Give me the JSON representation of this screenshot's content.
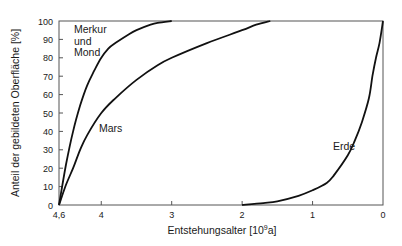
{
  "chart_data": {
    "type": "line",
    "title": "",
    "xlabel": "Entstehungsalter [10^9a]",
    "xlabel_main": "Entstehungsalter [10",
    "xlabel_sup": "9",
    "xlabel_tail": "a]",
    "ylabel": "Anteil der gebildeten Oberfläche [%]",
    "xlim": [
      4.6,
      0
    ],
    "ylim": [
      0,
      100
    ],
    "x_reversed": true,
    "grid": false,
    "x_ticks": [
      {
        "value": 4.6,
        "label": "4,6"
      },
      {
        "value": 4,
        "label": "4"
      },
      {
        "value": 3,
        "label": "3"
      },
      {
        "value": 2,
        "label": "2"
      },
      {
        "value": 1,
        "label": "1"
      },
      {
        "value": 0,
        "label": "0"
      }
    ],
    "y_ticks": [
      0,
      10,
      20,
      30,
      40,
      50,
      60,
      70,
      80,
      90,
      100
    ],
    "series": [
      {
        "name": "Merkur und Mond",
        "label_lines": [
          "Merkur",
          "und",
          "Mond"
        ],
        "x": [
          4.6,
          4.5,
          4.4,
          4.3,
          4.2,
          4.1,
          4.0,
          3.9,
          3.8,
          3.6,
          3.5,
          3.3,
          3.2,
          3.0
        ],
        "y": [
          0,
          22,
          40,
          54,
          65,
          73,
          80,
          85,
          88,
          93,
          95,
          98,
          99,
          100
        ]
      },
      {
        "name": "Mars",
        "label_lines": [
          "Mars"
        ],
        "x": [
          4.6,
          4.5,
          4.4,
          4.3,
          4.2,
          4.0,
          3.8,
          3.5,
          3.2,
          3.0,
          2.5,
          2.0,
          1.8,
          1.6
        ],
        "y": [
          0,
          11,
          20,
          30,
          38,
          50,
          58,
          68,
          76,
          80,
          88,
          95,
          98,
          100
        ]
      },
      {
        "name": "Erde",
        "label_lines": [
          "Erde"
        ],
        "x": [
          2.0,
          1.7,
          1.5,
          1.2,
          1.0,
          0.8,
          0.7,
          0.5,
          0.4,
          0.3,
          0.2,
          0.15,
          0.1,
          0.05,
          0.0
        ],
        "y": [
          0,
          1,
          2,
          5,
          8,
          12,
          16,
          27,
          35,
          45,
          58,
          70,
          80,
          88,
          100
        ]
      }
    ]
  }
}
